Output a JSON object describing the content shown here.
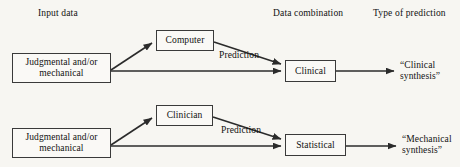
{
  "figure": {
    "background": "#f7f6f2",
    "stroke": "#2b2b2b",
    "box_fill": "#faf9f6"
  },
  "columns": [
    {
      "label": "Input data"
    },
    {
      "label": "Data combination"
    },
    {
      "label": "Type of prediction"
    }
  ],
  "rows": [
    {
      "id": "clinical-row",
      "input": "Judgmental and/or\nmechanical",
      "input_line1": "Judgmental and/or",
      "input_line2": "mechanical",
      "predictor": "Computer",
      "edge_label": "Prediction",
      "combiner": "Clinical",
      "outcome_line1": "“Clinical",
      "outcome_line2": "synthesis”"
    },
    {
      "id": "mechanical-row",
      "input": "Judgmental and/or\nmechanical",
      "input_line1": "Judgmental and/or",
      "input_line2": "mechanical",
      "predictor": "Clinician",
      "edge_label": "Prediction",
      "combiner": "Statistical",
      "outcome_line1": "“Mechanical",
      "outcome_line2": "synthesis”"
    }
  ]
}
